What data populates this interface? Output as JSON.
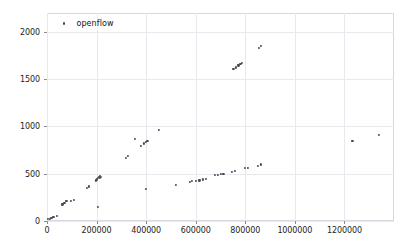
{
  "chart_data": {
    "type": "scatter",
    "title": "",
    "xlabel": "",
    "ylabel": "",
    "xlim": [
      0,
      1400000
    ],
    "ylim": [
      0,
      2200
    ],
    "grid": true,
    "legend_position": "top-left",
    "xticks": [
      0,
      200000,
      400000,
      600000,
      800000,
      1000000,
      1200000
    ],
    "xticklabels": [
      "0",
      "200000",
      "400000",
      "600000",
      "800000",
      "1000000",
      "1200000"
    ],
    "yticks": [
      0,
      500,
      1000,
      1500,
      2000
    ],
    "yticklabels": [
      "0",
      "500",
      "1000",
      "1500",
      "2000"
    ],
    "series": [
      {
        "name": "openflow",
        "marker": "dot",
        "color": "#4a4a55",
        "points": [
          [
            5000,
            20
          ],
          [
            12000,
            25
          ],
          [
            18000,
            30
          ],
          [
            26000,
            40
          ],
          [
            40000,
            55
          ],
          [
            62000,
            175
          ],
          [
            70000,
            195
          ],
          [
            78000,
            215
          ],
          [
            96000,
            215
          ],
          [
            110000,
            220
          ],
          [
            160000,
            350
          ],
          [
            170000,
            365
          ],
          [
            196000,
            430
          ],
          [
            200000,
            440
          ],
          [
            205000,
            455
          ],
          [
            208000,
            470
          ],
          [
            212000,
            460
          ],
          [
            214000,
            480
          ],
          [
            216000,
            470
          ],
          [
            205000,
            150
          ],
          [
            318000,
            670
          ],
          [
            325000,
            690
          ],
          [
            355000,
            865
          ],
          [
            380000,
            790
          ],
          [
            392000,
            820
          ],
          [
            398000,
            840
          ],
          [
            405000,
            850
          ],
          [
            400000,
            340
          ],
          [
            452000,
            965
          ],
          [
            520000,
            385
          ],
          [
            575000,
            415
          ],
          [
            585000,
            420
          ],
          [
            600000,
            425
          ],
          [
            615000,
            430
          ],
          [
            630000,
            440
          ],
          [
            640000,
            448
          ],
          [
            678000,
            485
          ],
          [
            690000,
            490
          ],
          [
            700000,
            498
          ],
          [
            712000,
            500
          ],
          [
            745000,
            520
          ],
          [
            758000,
            530
          ],
          [
            800000,
            560
          ],
          [
            812000,
            565
          ],
          [
            850000,
            580
          ],
          [
            862000,
            598
          ],
          [
            752000,
            1605
          ],
          [
            762000,
            1625
          ],
          [
            772000,
            1645
          ],
          [
            780000,
            1660
          ],
          [
            788000,
            1672
          ],
          [
            855000,
            1830
          ],
          [
            862000,
            1855
          ],
          [
            1232000,
            850
          ],
          [
            1338000,
            912
          ]
        ]
      }
    ]
  },
  "legend": {
    "label": "openflow"
  }
}
